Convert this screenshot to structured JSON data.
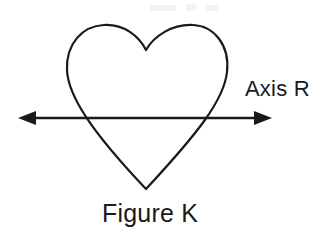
{
  "canvas": {
    "width": 333,
    "height": 236,
    "background_color": "#ffffff",
    "ink_color": "#1a1a1a"
  },
  "labels": {
    "axis_label": "Axis R",
    "figure_label": "Figure K"
  },
  "figure": {
    "shape_name": "heart",
    "stroke_color": "#1a1a1a",
    "stroke_width": 2,
    "fill": "none",
    "top_left_lobe_peak": [
      100,
      27
    ],
    "top_right_lobe_peak": [
      195,
      26
    ],
    "cleft_point": [
      146,
      50
    ],
    "leftmost_point": [
      67,
      80
    ],
    "rightmost_point": [
      228,
      78
    ],
    "bottom_tip": [
      146,
      189
    ]
  },
  "axis": {
    "name": "Axis R",
    "orientation": "horizontal",
    "double_headed": true,
    "y": 118,
    "x_start": 18,
    "x_end": 272,
    "stroke_color": "#1a1a1a",
    "stroke_width": 2,
    "arrowhead_length": 16,
    "arrowhead_half_width": 7,
    "crosses_shape_at_x": [
      83,
      210
    ]
  }
}
